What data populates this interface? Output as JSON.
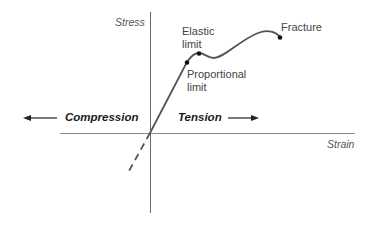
{
  "diagram": {
    "type": "stress-strain curve",
    "axes": {
      "y_label": "Stress",
      "x_label": "Strain"
    },
    "regions": {
      "left": "Compression",
      "right": "Tension"
    },
    "points": [
      {
        "id": "proportional_limit",
        "label_line1": "Proportional",
        "label_line2": "limit"
      },
      {
        "id": "elastic_limit",
        "label_line1": "Elastic",
        "label_line2": "limit"
      },
      {
        "id": "fracture",
        "label": "Fracture"
      }
    ],
    "colors": {
      "curve": "#555555",
      "axes": "#666666",
      "text": "#333333"
    }
  }
}
